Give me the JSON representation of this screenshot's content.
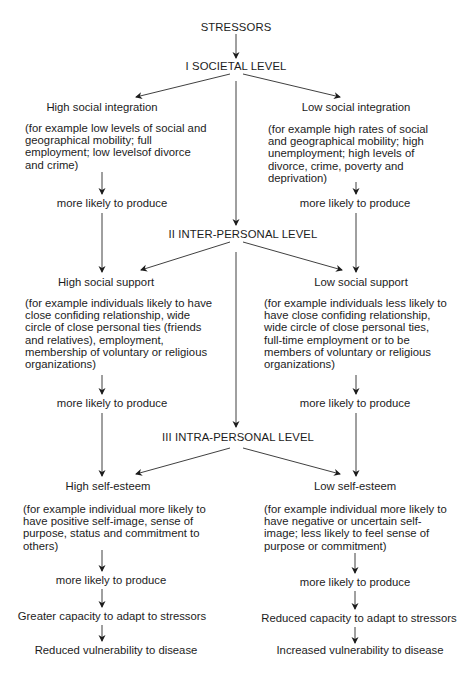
{
  "diagram": {
    "title": "STRESSORS",
    "levels": [
      {
        "label": "I  SOCIETAL LEVEL"
      },
      {
        "label": "II  INTER-PERSONAL LEVEL"
      },
      {
        "label": "III  INTRA-PERSONAL LEVEL"
      }
    ],
    "connector_label": "more likely to produce",
    "left": {
      "societal": {
        "heading": "High social integration",
        "body": "(for example low levels of social and\ngeographical mobility; full\nemployment; low levelsof divorce\nand crime)"
      },
      "interpersonal": {
        "heading": "High social support",
        "body": "(for example individuals likely to have\nclose confiding relationship, wide\ncircle of close personal ties (friends\nand relatives), employment,\nmembership of voluntary or religious\norganizations)"
      },
      "intrapersonal": {
        "heading": "High self-esteem",
        "body": "(for example individual more likely to\nhave positive self-image, sense of\npurpose, status and commitment to\nothers)"
      },
      "capacity": "Greater capacity to adapt to stressors",
      "outcome": "Reduced vulnerability to disease"
    },
    "right": {
      "societal": {
        "heading": "Low social integration",
        "body": "(for example high rates of social\nand geographical mobility; high\nunemployment; high levels of\ndivorce, crime, poverty and\ndeprivation)"
      },
      "interpersonal": {
        "heading": "Low social support",
        "body": "(for example individuals less likely to\nhave close confiding relationship,\nwide circle of close personal ties,\nfull-time employment or to be\nmembers of voluntary or religious\norganizations)"
      },
      "intrapersonal": {
        "heading": "Low self-esteem",
        "body": "(for example individual more likely to\nhave negative or uncertain self-\nimage; less likely to feel sense of\npurpose or commitment)"
      },
      "capacity": "Reduced capacity to adapt to stressors",
      "outcome": "Increased vulnerability to disease"
    },
    "colors": {
      "background": "#ffffff",
      "ink": "#1c1c1c"
    }
  }
}
